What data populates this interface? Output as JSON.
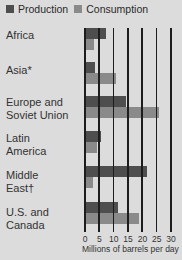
{
  "legend": {
    "production": "Production",
    "consumption": "Consumption"
  },
  "colors": {
    "production": "#4e4e4e",
    "consumption": "#8a8a8a",
    "background": "#dcdcdc"
  },
  "rows": [
    {
      "label_line1": "Africa",
      "label_line2": ""
    },
    {
      "label_line1": "Asia*",
      "label_line2": ""
    },
    {
      "label_line1": "Europe and",
      "label_line2": "Soviet Union"
    },
    {
      "label_line1": "Latin",
      "label_line2": "America"
    },
    {
      "label_line1": "Middle",
      "label_line2": "East†"
    },
    {
      "label_line1": "U.S. and",
      "label_line2": "Canada"
    }
  ],
  "axis": {
    "ticks": [
      "0",
      "5",
      "10",
      "15",
      "20",
      "25",
      "30"
    ],
    "xlabel": "Millions of barrels per day"
  },
  "chart_data": {
    "type": "bar",
    "orientation": "horizontal",
    "title": "",
    "categories": [
      "Africa",
      "Asia*",
      "Europe and Soviet Union",
      "Latin America",
      "Middle East†",
      "U.S. and Canada"
    ],
    "series": [
      {
        "name": "Production",
        "values": [
          7.5,
          4,
          14.5,
          6,
          22,
          12
        ]
      },
      {
        "name": "Consumption",
        "values": [
          3.5,
          11,
          26,
          4.5,
          3,
          19
        ]
      }
    ],
    "xlabel": "Millions of barrels per day",
    "ylabel": "",
    "xlim": [
      0,
      30
    ],
    "xticks": [
      0,
      5,
      10,
      15,
      20,
      25,
      30
    ],
    "grid": true,
    "legend_position": "top"
  }
}
